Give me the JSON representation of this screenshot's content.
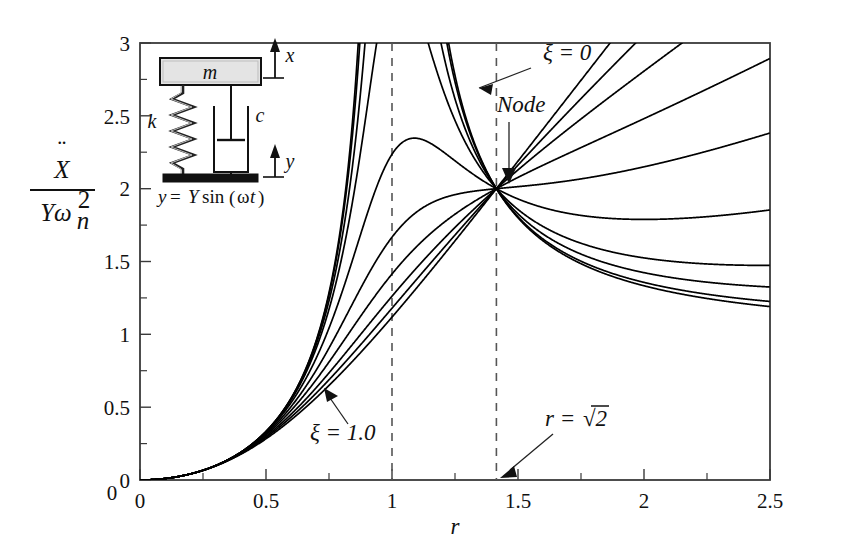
{
  "figure": {
    "caption": "Acceleration transmissibility for base excitation",
    "background": "#ffffff",
    "curve_color": "#000000",
    "axis_color": "#3a3a3a"
  },
  "axes": {
    "x": {
      "label": "r",
      "min": 0,
      "max": 2.5,
      "major_ticks": [
        0,
        0.5,
        1,
        1.5,
        2,
        2.5
      ],
      "tick_labels": [
        "0",
        "0.5",
        "1",
        "1.5",
        "2",
        "2.5"
      ],
      "minor_step": 0.25
    },
    "y": {
      "label_numerator": "X",
      "label_denominator": "Yω",
      "label_denom_sub": "n",
      "label_denom_sup": "2",
      "label_ddots": "¨",
      "min": 0,
      "max": 3,
      "major_ticks": [
        0,
        0.5,
        1,
        1.5,
        2,
        2.5,
        3
      ],
      "tick_labels": [
        "0",
        "0.5",
        "1",
        "1.5",
        "2",
        "2.5",
        "3"
      ],
      "minor_step": 0.25
    }
  },
  "annotations": [
    {
      "id": "zeta-zero",
      "text": "ξ = 0",
      "text_x": 543,
      "text_y": 58,
      "arrow_from_x": 528,
      "arrow_from_y": 68,
      "arrow_to_x": 468,
      "arrow_to_y": 92
    },
    {
      "id": "node",
      "text": "Node",
      "text_x": 497,
      "text_y": 110,
      "arrow_from_x": 512,
      "arrow_from_y": 118,
      "arrow_to_x": 508,
      "arrow_to_y": 180
    },
    {
      "id": "zeta-one",
      "text": "ξ = 1.0",
      "text_x": 310,
      "text_y": 438,
      "arrow_from_x": 345,
      "arrow_from_y": 421,
      "arrow_to_x": 330,
      "arrow_to_y": 390
    },
    {
      "id": "r-sqrt2",
      "text_plain": "r = ",
      "text_radical": "√2",
      "text_x": 545,
      "text_y": 424,
      "arrow_from_x": 557,
      "arrow_from_y": 434,
      "arrow_to_x": 510,
      "arrow_to_y": 478
    }
  ],
  "dashed_lines": [
    {
      "id": "r-equals-1",
      "r": 1.0
    },
    {
      "id": "r-equals-sqrt2",
      "r": 1.4142
    }
  ],
  "node_point": {
    "r": 1.4142,
    "value": 2.0
  },
  "schematic": {
    "mass_label": "m",
    "spring_label": "k",
    "damper_label": "c",
    "output_label": "x",
    "input_label": "y",
    "equation": "y = Y sin(ωt)",
    "equation_parts": {
      "lhs": "y",
      "equals": "=",
      "amplitude": "Y",
      "func": "sin",
      "open": "(",
      "omega": "ω",
      "t": "t",
      "close": ")"
    },
    "mass_fill": "#e4e4e4",
    "base_fill": "#111111"
  },
  "chart_data": {
    "type": "line",
    "title": "",
    "xlabel": "r",
    "ylabel": "Xddot / (Y omega_n^2)",
    "xlim": [
      0,
      2.5
    ],
    "ylim": [
      0,
      3
    ],
    "grid": false,
    "legend": "annotated in-plot",
    "formula": "r^2 * sqrt((1 + (2*zeta*r)^2) / ((1 - r^2)^2 + (2*zeta*r)^2))",
    "node": {
      "x": 1.4142,
      "y": 2.0
    },
    "series": [
      {
        "name": "ξ = 0",
        "zeta": 0.0
      },
      {
        "name": "ξ = 0.05",
        "zeta": 0.05
      },
      {
        "name": "ξ = 0.1",
        "zeta": 0.1
      },
      {
        "name": "ξ = 0.15",
        "zeta": 0.15
      },
      {
        "name": "ξ = 0.25",
        "zeta": 0.25
      },
      {
        "name": "ξ = 0.375",
        "zeta": 0.375
      },
      {
        "name": "ξ = 0.5",
        "zeta": 0.5
      },
      {
        "name": "ξ = 0.65",
        "zeta": 0.65
      },
      {
        "name": "ξ = 0.8",
        "zeta": 0.8
      },
      {
        "name": "ξ = 1.0",
        "zeta": 1.0
      }
    ],
    "sample_points": {
      "x": [
        0,
        0.25,
        0.5,
        0.75,
        1.0,
        1.25,
        1.4142,
        1.75,
        2.0,
        2.5
      ],
      "zeta_0": [
        0,
        0.067,
        0.333,
        1.286,
        null,
        3.0,
        2.0,
        1.585,
        1.333,
        1.19
      ],
      "zeta_0.1": [
        0,
        0.067,
        0.335,
        1.225,
        5.0,
        2.82,
        2.0,
        1.59,
        1.34,
        1.19
      ],
      "zeta_0.25": [
        0,
        0.067,
        0.34,
        1.09,
        2.24,
        2.22,
        2.0,
        1.63,
        1.39,
        1.21
      ],
      "zeta_0.5": [
        0,
        0.068,
        0.36,
        0.9,
        1.41,
        1.8,
        2.0,
        1.79,
        1.57,
        1.33
      ],
      "zeta_1.0": [
        0,
        0.072,
        0.4,
        0.8,
        1.12,
        1.52,
        2.0,
        2.13,
        2.06,
        1.25
      ]
    }
  }
}
